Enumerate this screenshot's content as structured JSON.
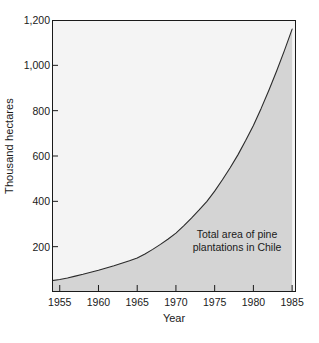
{
  "chart_data": {
    "type": "area",
    "title": "",
    "subtitle": "",
    "xlabel": "Year",
    "ylabel": "Thousand hectares",
    "xlim": [
      1954,
      1985.5
    ],
    "ylim": [
      0,
      1200
    ],
    "grid": false,
    "legend_position": "none",
    "annotations": [
      {
        "text_lines": [
          "Total area of pine",
          "plantations in Chile"
        ],
        "x": 1978,
        "y": 210
      }
    ],
    "x_ticks": [
      1955,
      1960,
      1965,
      1970,
      1975,
      1980,
      1985
    ],
    "x_tick_labels": [
      "1955",
      "1960",
      "1965",
      "1970",
      "1975",
      "1980",
      "1985"
    ],
    "y_ticks": [
      200,
      400,
      600,
      800,
      1000,
      1200
    ],
    "y_tick_labels": [
      "200",
      "400",
      "600",
      "800",
      "1,000",
      "1,200"
    ],
    "series": [
      {
        "name": "Total area of pine plantations in Chile",
        "fill_color": "#d4d4d4",
        "line_color": "#2b2b2b",
        "x": [
          1954,
          1955,
          1956,
          1957,
          1958,
          1959,
          1960,
          1961,
          1962,
          1963,
          1964,
          1965,
          1966,
          1967,
          1968,
          1969,
          1970,
          1971,
          1972,
          1973,
          1974,
          1975,
          1976,
          1977,
          1978,
          1979,
          1980,
          1981,
          1982,
          1983,
          1984,
          1985
        ],
        "values": [
          50,
          55,
          62,
          70,
          78,
          87,
          96,
          106,
          116,
          127,
          138,
          150,
          168,
          188,
          210,
          234,
          260,
          292,
          326,
          362,
          400,
          445,
          495,
          548,
          605,
          668,
          735,
          810,
          890,
          975,
          1065,
          1160
        ]
      }
    ],
    "colors": {
      "plot_background": "#f4f4f4",
      "area_fill": "#d4d4d4",
      "curve": "#2b2b2b",
      "axis": "#1a1a1a",
      "text": "#1a1a1a",
      "page_background": "#ffffff"
    }
  }
}
